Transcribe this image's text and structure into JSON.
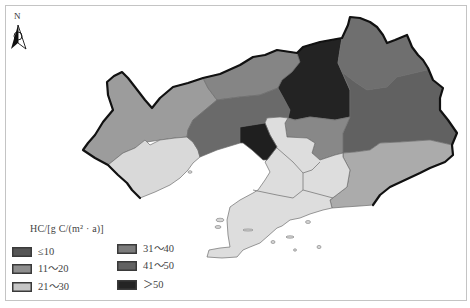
{
  "north_arrow": {
    "label": "N",
    "icon": "north-arrow-icon"
  },
  "legend": {
    "title": "HC/[g C/(m² · a)]",
    "items": [
      {
        "label": "≤10",
        "color": "#565656"
      },
      {
        "label": "11～20",
        "color": "#8e8e8e"
      },
      {
        "label": "21～30",
        "color": "#c6c6c6"
      },
      {
        "label": "31～40",
        "color": "#7c7c7c"
      },
      {
        "label": "41～50",
        "color": "#626262"
      },
      {
        "label": "＞50",
        "color": "#242424"
      }
    ]
  },
  "map": {
    "frame_color": "#c4c4c4",
    "border_color": "#111111",
    "regions": [
      {
        "id": "west",
        "fill": "#9c9c9c"
      },
      {
        "id": "southwest",
        "fill": "#d9d9d9"
      },
      {
        "id": "north-band",
        "fill": "#858585"
      },
      {
        "id": "central-band",
        "fill": "#6a6a6a"
      },
      {
        "id": "north-central",
        "fill": "#232323"
      },
      {
        "id": "northeast",
        "fill": "#6f6f6f"
      },
      {
        "id": "east",
        "fill": "#616161"
      },
      {
        "id": "central-east",
        "fill": "#888888"
      },
      {
        "id": "southeast",
        "fill": "#ababab"
      },
      {
        "id": "south-peninsula",
        "fill": "#dddddd"
      },
      {
        "id": "gulf-coast",
        "fill": "#1f1f1f"
      }
    ]
  }
}
